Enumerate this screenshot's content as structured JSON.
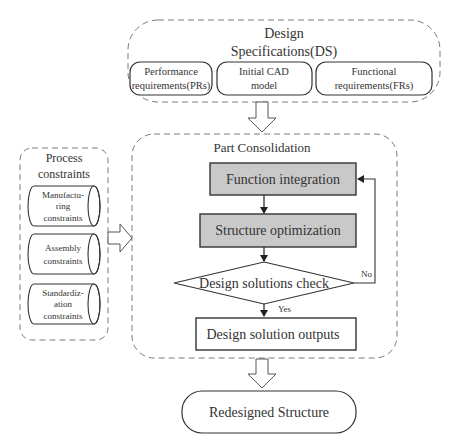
{
  "design_specifications": {
    "title_line1": "Design",
    "title_line2": "Specifications(DS)",
    "items": [
      {
        "line1": "Performance",
        "line2": "requirements(PRs)"
      },
      {
        "line1": "Initial CAD",
        "line2": "model"
      },
      {
        "line1": "Functional",
        "line2": "requirements(FRs)"
      }
    ]
  },
  "process_constraints": {
    "title_line1": "Process",
    "title_line2": "constraints",
    "items": [
      {
        "lines": [
          "Manufactu-",
          "ring",
          "constraints"
        ]
      },
      {
        "lines": [
          "Assembly",
          "constraints"
        ]
      },
      {
        "lines": [
          "Standardiz-",
          "ation",
          "constraints"
        ]
      }
    ]
  },
  "part_consolidation": {
    "title": "Part Consolidation",
    "function_integration": "Function integration",
    "structure_optimization": "Structure optimization",
    "decision": "Design solutions check",
    "no_label": "No",
    "yes_label": "Yes",
    "outputs": "Design solution outputs"
  },
  "result": {
    "label": "Redesigned Structure"
  },
  "colors": {
    "process_fill": "#c9c9c9",
    "stroke": "#333333",
    "dashed": "#7a7a7a"
  }
}
